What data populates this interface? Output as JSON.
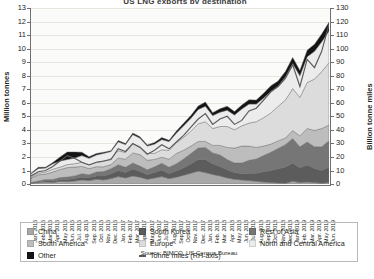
{
  "chart_data": {
    "type": "area",
    "title": "US LNG exports by destination",
    "source": "Source: BIMCO, US Census Bureau",
    "stacked": true,
    "grid": true,
    "legend_position": "bottom",
    "xlabel": "",
    "ylabel": "Million tonnes",
    "ylabel_right": "Billion tonne miles",
    "ylim": [
      0,
      13
    ],
    "ylim_right": [
      0,
      130
    ],
    "yticks": [
      0,
      1,
      2,
      3,
      4,
      5,
      6,
      7,
      8,
      9,
      10,
      11,
      12,
      13
    ],
    "yticks_right": [
      0,
      10,
      20,
      30,
      40,
      50,
      60,
      70,
      80,
      90,
      100,
      110,
      120,
      130
    ],
    "categories": [
      "Jan. 2016",
      "Feb. 2016",
      "Mar. 2016",
      "Apr. 2016",
      "May 2016",
      "Jun. 2016",
      "Jul. 2016",
      "Aug. 2016",
      "Sep. 2016",
      "Oct. 2016",
      "Nov. 2016",
      "Dec. 2016",
      "Jan. 2017",
      "Feb. 2017",
      "Mar. 2017",
      "Apr. 2017",
      "May 2017",
      "Jun. 2017",
      "Jul. 2017",
      "Aug. 2017",
      "Sep. 2017",
      "Oct. 2017",
      "Nov. 2017",
      "Dec. 2017",
      "Jan. 2018",
      "Feb. 2018",
      "Mar. 2018",
      "Apr. 2018",
      "May 2018",
      "Jun. 2018",
      "Jul. 2018",
      "Aug. 2018",
      "Sep. 2018",
      "Oct. 2018",
      "Nov. 2018",
      "Dec. 2018",
      "Jan. 2019",
      "Feb. 2019",
      "Mar. 2019",
      "Apr. 2019",
      "May 2019",
      "Jun. 2019"
    ],
    "series": [
      {
        "name": "China",
        "color": "#a8a8a8",
        "values": [
          0.05,
          0.1,
          0.15,
          0.12,
          0.2,
          0.18,
          0.22,
          0.3,
          0.25,
          0.35,
          0.3,
          0.4,
          0.55,
          0.45,
          0.6,
          0.5,
          0.35,
          0.45,
          0.55,
          0.4,
          0.5,
          0.65,
          0.8,
          0.95,
          0.85,
          0.7,
          0.6,
          0.45,
          0.35,
          0.3,
          0.25,
          0.2,
          0.15,
          0.1,
          0.08,
          0.05,
          0.2,
          0.1,
          0.15,
          0.1,
          0.05,
          0.1
        ]
      },
      {
        "name": "South Korea",
        "color": "#5c5c5c",
        "values": [
          0.02,
          0.05,
          0.08,
          0.1,
          0.12,
          0.15,
          0.18,
          0.2,
          0.22,
          0.25,
          0.3,
          0.35,
          0.45,
          0.4,
          0.5,
          0.42,
          0.35,
          0.4,
          0.48,
          0.38,
          0.45,
          0.55,
          0.7,
          0.85,
          0.95,
          0.8,
          0.7,
          0.6,
          0.5,
          0.45,
          0.55,
          0.6,
          0.75,
          0.9,
          1.05,
          1.2,
          1.35,
          1.1,
          1.25,
          1.05,
          0.95,
          1.15
        ]
      },
      {
        "name": "Rest of Asia",
        "color": "#767676",
        "values": [
          0.05,
          0.08,
          0.1,
          0.12,
          0.15,
          0.18,
          0.2,
          0.25,
          0.22,
          0.28,
          0.32,
          0.38,
          0.42,
          0.38,
          0.45,
          0.4,
          0.35,
          0.42,
          0.5,
          0.45,
          0.55,
          0.65,
          0.75,
          0.85,
          0.9,
          0.8,
          0.85,
          0.75,
          0.7,
          0.8,
          0.95,
          1.05,
          1.2,
          1.35,
          1.5,
          1.65,
          1.8,
          1.55,
          1.7,
          1.6,
          1.75,
          1.95
        ]
      },
      {
        "name": "South America",
        "color": "#bdbdbd",
        "values": [
          0.3,
          0.45,
          0.4,
          0.55,
          0.6,
          0.7,
          0.65,
          0.55,
          0.45,
          0.4,
          0.35,
          0.3,
          0.5,
          0.6,
          0.75,
          0.85,
          0.7,
          0.55,
          0.45,
          0.6,
          0.75,
          0.65,
          0.55,
          0.5,
          0.45,
          0.55,
          0.7,
          0.9,
          1.1,
          1.25,
          1.05,
          0.85,
          0.7,
          0.6,
          0.55,
          0.5,
          0.6,
          0.8,
          1.0,
          1.2,
          1.35,
          1.15
        ]
      },
      {
        "name": "Europe",
        "color": "#dcdcdc",
        "values": [
          0.08,
          0.12,
          0.15,
          0.2,
          0.18,
          0.22,
          0.25,
          0.3,
          0.28,
          0.32,
          0.4,
          0.45,
          0.55,
          0.5,
          0.65,
          0.6,
          0.5,
          0.45,
          0.55,
          0.65,
          0.8,
          0.95,
          1.1,
          1.3,
          1.45,
          1.25,
          1.4,
          1.55,
          1.35,
          1.5,
          1.7,
          1.9,
          2.1,
          2.3,
          2.55,
          2.8,
          3.1,
          2.85,
          3.4,
          3.8,
          4.2,
          4.6
        ]
      },
      {
        "name": "North and Central America",
        "color": "#ececec",
        "values": [
          0.25,
          0.35,
          0.3,
          0.4,
          0.45,
          0.38,
          0.42,
          0.5,
          0.48,
          0.55,
          0.6,
          0.52,
          0.65,
          0.58,
          0.7,
          0.62,
          0.55,
          0.68,
          0.75,
          0.65,
          0.72,
          0.85,
          0.95,
          1.05,
          1.15,
          0.95,
          1.05,
          1.2,
          1.1,
          1.25,
          1.4,
          1.3,
          1.45,
          1.6,
          1.5,
          1.7,
          1.85,
          1.6,
          1.9,
          2.05,
          2.2,
          2.35
        ]
      },
      {
        "name": "Other",
        "color": "#141414",
        "values": [
          0.05,
          0.08,
          0.06,
          0.1,
          0.3,
          0.55,
          0.45,
          0.25,
          0.12,
          0.1,
          0.08,
          0.06,
          0.1,
          0.08,
          0.12,
          0.1,
          0.08,
          0.12,
          0.15,
          0.1,
          0.14,
          0.18,
          0.22,
          0.26,
          0.3,
          0.22,
          0.26,
          0.3,
          0.25,
          0.28,
          0.32,
          0.3,
          0.35,
          0.4,
          0.38,
          0.42,
          0.45,
          0.38,
          0.48,
          0.52,
          0.58,
          0.65
        ]
      }
    ],
    "line_series": {
      "name": "Tonne miles (RH-axis)",
      "color": "#58595b",
      "axis": "right",
      "values": [
        6,
        9,
        10,
        13,
        17,
        21,
        19,
        16,
        14,
        16,
        17,
        18,
        26,
        24,
        30,
        27,
        22,
        25,
        29,
        26,
        31,
        36,
        42,
        48,
        52,
        44,
        48,
        50,
        44,
        47,
        54,
        56,
        62,
        68,
        72,
        78,
        88,
        72,
        92,
        86,
        98,
        118
      ]
    }
  },
  "legend": {
    "items": [
      {
        "label": "China",
        "swatch": "#a8a8a8",
        "type": "area"
      },
      {
        "label": "South America",
        "swatch": "#bdbdbd",
        "type": "area"
      },
      {
        "label": "Other",
        "swatch": "#141414",
        "type": "area"
      },
      {
        "label": "South Korea",
        "swatch": "#5c5c5c",
        "type": "area"
      },
      {
        "label": "Europe",
        "swatch": "#dcdcdc",
        "type": "area"
      },
      {
        "label": "Tonne miles (RH-axis)",
        "swatch": "#58595b",
        "type": "line"
      },
      {
        "label": "Rest of Asia",
        "swatch": "#767676",
        "type": "area"
      },
      {
        "label": "North and Central America",
        "swatch": "#ececec",
        "type": "area"
      }
    ]
  }
}
